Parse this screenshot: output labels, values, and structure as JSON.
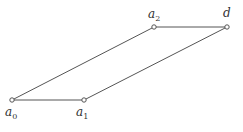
{
  "diagram": {
    "type": "parallelogram",
    "stroke_color": "#555555",
    "points": [
      {
        "id": "a0",
        "base": "a",
        "sub": "0",
        "x": 12,
        "y": 100,
        "label_x": 5,
        "label_y": 116
      },
      {
        "id": "a1",
        "base": "a",
        "sub": "1",
        "x": 84,
        "y": 100,
        "label_x": 76,
        "label_y": 116
      },
      {
        "id": "a2",
        "base": "a",
        "sub": "2",
        "x": 154,
        "y": 27,
        "label_x": 148,
        "label_y": 18
      },
      {
        "id": "d",
        "base": "d",
        "sub": "",
        "x": 227,
        "y": 27,
        "label_x": 223,
        "label_y": 17
      }
    ],
    "edges": [
      [
        "a0",
        "a1"
      ],
      [
        "a1",
        "d"
      ],
      [
        "d",
        "a2"
      ],
      [
        "a2",
        "a0"
      ]
    ]
  }
}
